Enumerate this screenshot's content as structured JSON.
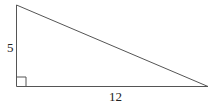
{
  "diagram": {
    "type": "right-triangle",
    "stroke_color": "#555555",
    "labels": {
      "vertical_leg": "5",
      "horizontal_leg": "12"
    },
    "right_angle_marker": true
  }
}
